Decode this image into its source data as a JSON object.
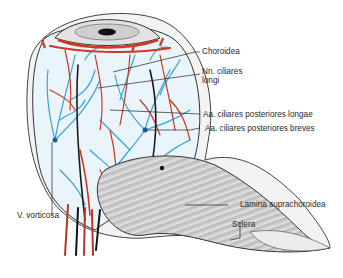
{
  "figure": {
    "labels": [
      {
        "id": "choroidea",
        "text": "Choroidea"
      },
      {
        "id": "nn-ciliares-longi-1",
        "text": "Nn. ciliares"
      },
      {
        "id": "nn-ciliares-longi-2",
        "text": "longi"
      },
      {
        "id": "aa-ciliares-longae",
        "text": "Aa. ciliares posteriores longae"
      },
      {
        "id": "aa-ciliares-breves",
        "text": "Aa. ciliares posteriores breves"
      },
      {
        "id": "v-vorticosa",
        "text": "V. vorticosa"
      },
      {
        "id": "lamina-suprachoroidea",
        "text": "Lamina suprachoroidea"
      },
      {
        "id": "sclera",
        "text": "Sclera"
      }
    ],
    "colors": {
      "artery": "#d0361e",
      "vein": "#3a9fd8",
      "nerve": "#1a1a1a",
      "sclera": "#e8e8e8",
      "outline": "#333333",
      "label_text": "#2a2a2a"
    }
  }
}
